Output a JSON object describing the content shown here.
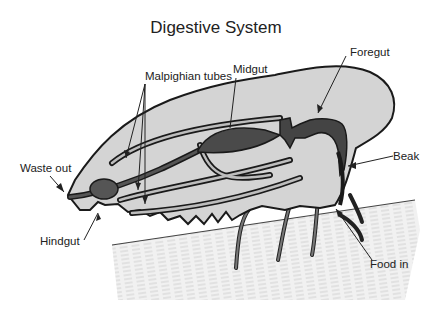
{
  "diagram": {
    "title": "Digestive System",
    "labels": {
      "foregut": "Foregut",
      "midgut": "Midgut",
      "malpighian": "Malpighian tubes",
      "waste_out": "Waste out",
      "hindgut": "Hindgut",
      "beak": "Beak",
      "food_in": "Food in"
    },
    "colors": {
      "body_fill": "#d4d4d4",
      "organ_fill": "#555555",
      "outline": "#1a1a1a",
      "stem_fill": "#eeeeee"
    }
  }
}
